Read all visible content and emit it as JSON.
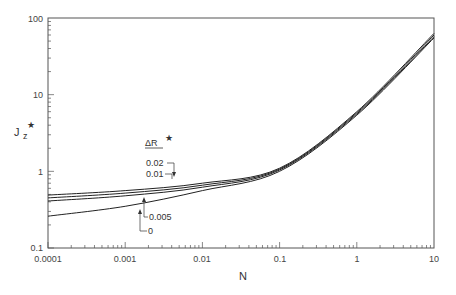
{
  "chart_data": {
    "type": "line",
    "title": "",
    "xlabel": "N",
    "ylabel": "J_z*",
    "xscale": "log",
    "yscale": "log",
    "xlim": [
      0.0001,
      10
    ],
    "ylim": [
      0.1,
      100
    ],
    "x_ticks": [
      "0.0001",
      "0.001",
      "0.01",
      "0.1",
      "1",
      "10"
    ],
    "y_ticks": [
      "0.1",
      "1",
      "10",
      "100"
    ],
    "grid": false,
    "legend_title": "ΔR*",
    "x": [
      0.0001,
      0.001,
      0.01,
      0.1,
      1,
      10
    ],
    "series": [
      {
        "name": "0.02",
        "values": [
          0.49,
          0.56,
          0.7,
          1.1,
          6.0,
          63
        ]
      },
      {
        "name": "0.01",
        "values": [
          0.45,
          0.52,
          0.66,
          1.07,
          5.8,
          60
        ]
      },
      {
        "name": "0.005",
        "values": [
          0.41,
          0.48,
          0.62,
          1.04,
          5.6,
          57
        ]
      },
      {
        "name": "0",
        "values": [
          0.26,
          0.35,
          0.56,
          1.0,
          5.4,
          55
        ]
      }
    ],
    "annotations": [
      {
        "label": "0.02",
        "points_to_N": 0.004
      },
      {
        "label": "0.01",
        "points_to_N": 0.004
      },
      {
        "label": "0.005",
        "points_to_N": 0.0018
      },
      {
        "label": "0",
        "points_to_N": 0.0016
      }
    ]
  },
  "labels": {
    "y0": "0.1",
    "y1": "1",
    "y2": "10",
    "y3": "100",
    "x0": "0.0001",
    "x1": "0.001",
    "x2": "0.01",
    "x3": "0.1",
    "x4": "1",
    "x5": "10",
    "xlabel": "N",
    "ylabel_main": "J",
    "ylabel_sub": "z",
    "star": "★",
    "legend_title": "ΔR",
    "a1": "0.02",
    "a2": "0.01",
    "a3": "0.005",
    "a4": "0"
  }
}
